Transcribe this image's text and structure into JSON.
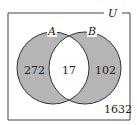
{
  "diagram": {
    "type": "venn",
    "universe_label": "U",
    "sets": [
      {
        "label": "A",
        "only_value": "272"
      },
      {
        "label": "B",
        "only_value": "102"
      }
    ],
    "intersection_value": "17",
    "outside_value": "1632",
    "colors": {
      "shaded": "#b5b5b5",
      "outline": "#333333",
      "background": "#ffffff"
    }
  }
}
